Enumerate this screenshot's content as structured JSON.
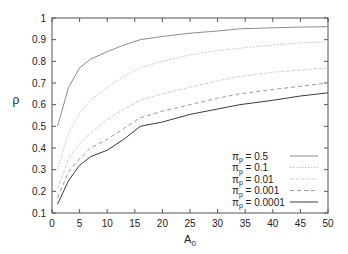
{
  "chart_data": {
    "type": "line",
    "title": "",
    "xlabel": "A",
    "xlabel_sub": "0",
    "ylabel": "ρ",
    "xlim": [
      0,
      50
    ],
    "ylim": [
      0.1,
      1
    ],
    "xticks": [
      0,
      5,
      10,
      15,
      20,
      25,
      30,
      35,
      40,
      45,
      50
    ],
    "yticks": [
      0.1,
      0.2,
      0.3,
      0.4,
      0.5,
      0.6,
      0.7,
      0.8,
      0.9,
      1
    ],
    "ytick_labels": [
      "0.1",
      "0.2",
      "0.3",
      "0.4",
      "0.5",
      "0.6",
      "0.7",
      "0.8",
      "0.9",
      "1"
    ],
    "grid": false,
    "legend_position": "lower right",
    "x": [
      1,
      3,
      5,
      7,
      10,
      13,
      16,
      20,
      25,
      30,
      34,
      40,
      45,
      50
    ],
    "series": [
      {
        "name": "π_p = 0.5",
        "label_sym": "π",
        "label_sub": "p",
        "label_val": " = 0.5",
        "color": "#8c8c8c",
        "dash": "",
        "width": 1,
        "values": [
          0.5,
          0.68,
          0.77,
          0.81,
          0.845,
          0.875,
          0.9,
          0.915,
          0.93,
          0.94,
          0.95,
          0.955,
          0.958,
          0.96
        ]
      },
      {
        "name": "π_p = 0.1",
        "label_sym": "π",
        "label_sub": "p",
        "label_val": " = 0.1",
        "color": "#c4c4c4",
        "dash": "1.5,1.5",
        "width": 1,
        "values": [
          0.3,
          0.47,
          0.56,
          0.62,
          0.68,
          0.73,
          0.77,
          0.8,
          0.83,
          0.85,
          0.86,
          0.875,
          0.885,
          0.89
        ]
      },
      {
        "name": "π_p = 0.01",
        "label_sym": "π",
        "label_sub": "p",
        "label_val": " = 0.01",
        "color": "#cfcfcf",
        "dash": "4,1.5",
        "width": 1,
        "values": [
          0.21,
          0.35,
          0.42,
          0.47,
          0.53,
          0.58,
          0.62,
          0.65,
          0.68,
          0.71,
          0.73,
          0.75,
          0.76,
          0.77
        ]
      },
      {
        "name": "π_p = 0.001",
        "label_sym": "π",
        "label_sub": "p",
        "label_val": " = 0.001",
        "color": "#9a9a9a",
        "dash": "4,3",
        "width": 1,
        "values": [
          0.17,
          0.29,
          0.35,
          0.4,
          0.44,
          0.49,
          0.54,
          0.57,
          0.6,
          0.63,
          0.65,
          0.67,
          0.685,
          0.7
        ]
      },
      {
        "name": "π_p = 0.0001",
        "label_sym": "π",
        "label_sub": "p",
        "label_val": " = 0.0001",
        "color": "#3a3a3a",
        "dash": "",
        "width": 1,
        "values": [
          0.14,
          0.25,
          0.32,
          0.36,
          0.39,
          0.44,
          0.5,
          0.52,
          0.555,
          0.58,
          0.6,
          0.62,
          0.64,
          0.655
        ]
      }
    ]
  }
}
